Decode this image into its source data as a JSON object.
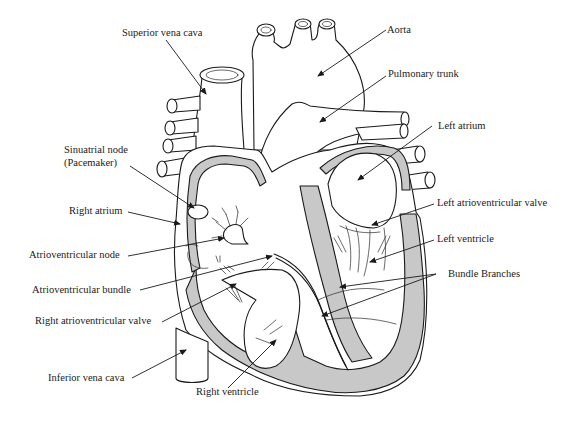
{
  "diagram": {
    "colors": {
      "ink": "#1a1a1a",
      "myocardium_fill": "#c8c8c8",
      "background": "#ffffff"
    },
    "labels": {
      "superior_vena_cava": "Superior vena cava",
      "aorta": "Aorta",
      "pulmonary_trunk": "Pulmonary trunk",
      "left_atrium": "Left atrium",
      "sinuatrial_node_line1": "Sinuatrial node",
      "sinuatrial_node_line2": "(Pacemaker)",
      "right_atrium": "Right atrium",
      "left_atrioventricular_valve": "Left atrioventricular valve",
      "atrioventricular_node": "Atrioventricular node",
      "left_ventricle": "Left ventricle",
      "bundle_branches": "Bundle Branches",
      "atrioventricular_bundle": "Atrioventricular bundle",
      "right_atrioventricular_valve": "Right atrioventricular valve",
      "inferior_vena_cava": "Inferior vena cava",
      "right_ventricle": "Right ventricle"
    }
  }
}
